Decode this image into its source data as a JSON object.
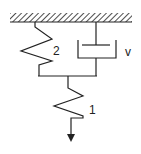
{
  "diagram": {
    "type": "mechanical-model",
    "labels": {
      "spring_upper": "2",
      "dashpot": "v",
      "spring_lower": "1"
    },
    "colors": {
      "line": "#222222",
      "background": "#ffffff"
    }
  }
}
